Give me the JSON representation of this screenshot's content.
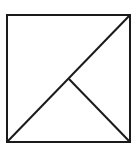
{
  "diagram": {
    "background": "#ffffff",
    "stroke_color": "#1a1a1a",
    "stroke_width": 2,
    "square": {
      "x": 7,
      "y": 15,
      "width": 123,
      "height": 127
    },
    "lines": [
      {
        "name": "diagonal",
        "x1": 7,
        "y1": 142,
        "x2": 130,
        "y2": 15
      },
      {
        "name": "midpoint-to-corner",
        "x1": 69,
        "y1": 79,
        "x2": 130,
        "y2": 142
      }
    ]
  }
}
